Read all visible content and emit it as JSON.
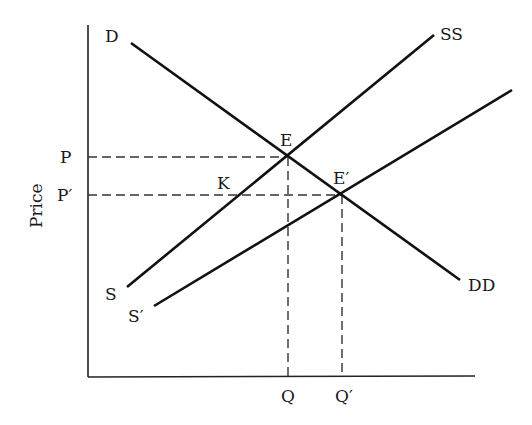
{
  "diagram": {
    "type": "supply-demand",
    "y_axis_label": "Price",
    "x_axis_label": "",
    "curves": [
      {
        "id": "demand",
        "label_start": "D",
        "label_end": "DD",
        "x1": 131,
        "y1": 43,
        "x2": 460,
        "y2": 280
      },
      {
        "id": "supply",
        "label_start": "S",
        "label_end": "SS",
        "x1": 127,
        "y1": 287,
        "x2": 434,
        "y2": 35
      },
      {
        "id": "supply-shifted",
        "label_start": "S′",
        "label_end": "",
        "x1": 154,
        "y1": 306,
        "x2": 512,
        "y2": 90
      }
    ],
    "points": {
      "E": {
        "label": "E",
        "x": 287,
        "y": 156
      },
      "E_prime": {
        "label": "E′",
        "x": 341,
        "y": 194
      },
      "K": {
        "label": "K"
      }
    },
    "price_ticks": {
      "P": "P",
      "P_prime": "P′"
    },
    "quantity_ticks": {
      "Q": "Q",
      "Q_prime": "Q′"
    }
  }
}
